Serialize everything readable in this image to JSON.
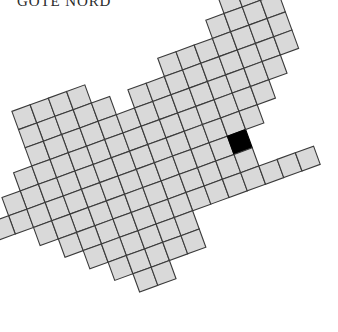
{
  "figure": {
    "title": "GOTE NORD",
    "type": "rotated-grid-map",
    "colors": {
      "cell_fill": "#d9d9d9",
      "cell_stroke": "#3a3a3a",
      "highlight_fill": "#000000",
      "background": "#ffffff",
      "title_color": "#2b2b2b"
    },
    "grid": {
      "cell_size": 19.4,
      "rotation_deg": -20,
      "origin_x": 118,
      "origin_y": 176,
      "stroke_width": 1.1
    },
    "highlight_cell": {
      "col": 6,
      "row": 0
    },
    "cells": [
      {
        "col": -4,
        "row": -5
      },
      {
        "col": -3,
        "row": -5
      },
      {
        "col": -3,
        "row": -4
      },
      {
        "col": -2,
        "row": -5
      },
      {
        "col": -2,
        "row": -4
      },
      {
        "col": -2,
        "row": -3
      },
      {
        "col": -1,
        "row": -5
      },
      {
        "col": -1,
        "row": -4
      },
      {
        "col": -1,
        "row": -3
      },
      {
        "col": -1,
        "row": -2
      },
      {
        "col": 0,
        "row": -4
      },
      {
        "col": 0,
        "row": -3
      },
      {
        "col": 0,
        "row": -2
      },
      {
        "col": 0,
        "row": -1
      },
      {
        "col": 1,
        "row": -3
      },
      {
        "col": 1,
        "row": -2
      },
      {
        "col": 1,
        "row": -1
      },
      {
        "col": 1,
        "row": 0
      },
      {
        "col": 2,
        "row": -4
      },
      {
        "col": 2,
        "row": -3
      },
      {
        "col": 2,
        "row": -2
      },
      {
        "col": 2,
        "row": -1
      },
      {
        "col": 2,
        "row": 0
      },
      {
        "col": 2,
        "row": 1
      },
      {
        "col": 3,
        "row": -4
      },
      {
        "col": 3,
        "row": -3
      },
      {
        "col": 3,
        "row": -2
      },
      {
        "col": 3,
        "row": -1
      },
      {
        "col": 3,
        "row": 0
      },
      {
        "col": 3,
        "row": 1
      },
      {
        "col": 3,
        "row": 2
      },
      {
        "col": 4,
        "row": -5
      },
      {
        "col": 4,
        "row": -4
      },
      {
        "col": 4,
        "row": -3
      },
      {
        "col": 4,
        "row": -2
      },
      {
        "col": 4,
        "row": -1
      },
      {
        "col": 4,
        "row": 0
      },
      {
        "col": 4,
        "row": 1
      },
      {
        "col": 4,
        "row": 2
      },
      {
        "col": 5,
        "row": -5
      },
      {
        "col": 5,
        "row": -4
      },
      {
        "col": 5,
        "row": -3
      },
      {
        "col": 5,
        "row": -2
      },
      {
        "col": 5,
        "row": -1
      },
      {
        "col": 5,
        "row": 0
      },
      {
        "col": 5,
        "row": 1
      },
      {
        "col": 5,
        "row": 2
      },
      {
        "col": 6,
        "row": -5
      },
      {
        "col": 6,
        "row": -4
      },
      {
        "col": 6,
        "row": -3
      },
      {
        "col": 6,
        "row": -2
      },
      {
        "col": 6,
        "row": -1
      },
      {
        "col": 6,
        "row": 0
      },
      {
        "col": 6,
        "row": 1
      },
      {
        "col": 6,
        "row": 2
      },
      {
        "col": 7,
        "row": -6
      },
      {
        "col": 7,
        "row": -5
      },
      {
        "col": 7,
        "row": -4
      },
      {
        "col": 7,
        "row": -3
      },
      {
        "col": 7,
        "row": -2
      },
      {
        "col": 7,
        "row": -1
      },
      {
        "col": 7,
        "row": 2
      },
      {
        "col": 8,
        "row": -7
      },
      {
        "col": 8,
        "row": -6
      },
      {
        "col": 8,
        "row": -5
      },
      {
        "col": 8,
        "row": -4
      },
      {
        "col": 8,
        "row": -3
      },
      {
        "col": 8,
        "row": -2
      },
      {
        "col": 8,
        "row": 2
      },
      {
        "col": 9,
        "row": -8
      },
      {
        "col": 9,
        "row": -7
      },
      {
        "col": 9,
        "row": -6
      },
      {
        "col": 9,
        "row": -5
      },
      {
        "col": 9,
        "row": -4
      },
      {
        "col": 9,
        "row": -3
      },
      {
        "col": 9,
        "row": 2
      },
      {
        "col": 10,
        "row": -8
      },
      {
        "col": 10,
        "row": -7
      },
      {
        "col": 10,
        "row": -6
      },
      {
        "col": 10,
        "row": -5
      },
      {
        "col": 10,
        "row": -4
      },
      {
        "col": 11,
        "row": -8
      },
      {
        "col": 11,
        "row": -7
      },
      {
        "col": -5,
        "row": -2
      },
      {
        "col": -5,
        "row": -1
      },
      {
        "col": -6,
        "row": -1
      },
      {
        "col": -6,
        "row": 0
      },
      {
        "col": -7,
        "row": 0
      },
      {
        "col": -4,
        "row": -4
      },
      {
        "col": -4,
        "row": -3
      },
      {
        "col": -4,
        "row": -2
      },
      {
        "col": -4,
        "row": -1
      },
      {
        "col": -4,
        "row": 0
      },
      {
        "col": -3,
        "row": -3
      },
      {
        "col": -3,
        "row": -2
      },
      {
        "col": -3,
        "row": -1
      },
      {
        "col": -3,
        "row": 0
      },
      {
        "col": -3,
        "row": 1
      },
      {
        "col": -2,
        "row": -2
      },
      {
        "col": -2,
        "row": -1
      },
      {
        "col": -2,
        "row": 0
      },
      {
        "col": -2,
        "row": 1
      },
      {
        "col": -2,
        "row": 2
      },
      {
        "col": -1,
        "row": -1
      },
      {
        "col": -1,
        "row": 0
      },
      {
        "col": -1,
        "row": 1
      },
      {
        "col": -1,
        "row": 2
      },
      {
        "col": -1,
        "row": 3
      },
      {
        "col": 0,
        "row": 0
      },
      {
        "col": 0,
        "row": 1
      },
      {
        "col": 0,
        "row": 2
      },
      {
        "col": 0,
        "row": 3
      },
      {
        "col": 0,
        "row": 4
      },
      {
        "col": 1,
        "row": 1
      },
      {
        "col": 1,
        "row": 2
      },
      {
        "col": 1,
        "row": 3
      },
      {
        "col": 1,
        "row": 4
      },
      {
        "col": 2,
        "row": 2
      },
      {
        "col": 2,
        "row": 3
      },
      {
        "col": 2,
        "row": 4
      },
      {
        "col": -5,
        "row": 0
      },
      {
        "col": -5,
        "row": 1
      },
      {
        "col": -4,
        "row": 1
      },
      {
        "col": -4,
        "row": 2
      },
      {
        "col": -3,
        "row": 2
      },
      {
        "col": -3,
        "row": 3
      },
      {
        "col": -2,
        "row": 3
      },
      {
        "col": -2,
        "row": 4
      },
      {
        "col": -1,
        "row": 4
      },
      {
        "col": -1,
        "row": 5
      },
      {
        "col": 0,
        "row": 5
      }
    ]
  }
}
